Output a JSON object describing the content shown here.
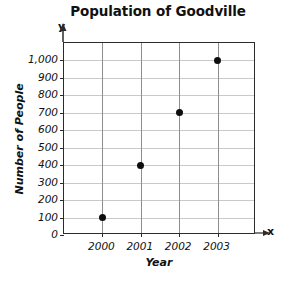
{
  "chart_data": {
    "type": "scatter",
    "title": "Population of Goodville",
    "xlabel": "Year",
    "ylabel": "Number of People",
    "x_axis_letter": "x",
    "y_axis_letter": "y",
    "categories": [
      "2000",
      "2001",
      "2002",
      "2003"
    ],
    "x": [
      2000,
      2001,
      2002,
      2003
    ],
    "values": [
      100,
      400,
      700,
      1000
    ],
    "points": [
      {
        "x": "2000",
        "y": 100
      },
      {
        "x": "2001",
        "y": 400
      },
      {
        "x": "2002",
        "y": 700
      },
      {
        "x": "2003",
        "y": 1000
      }
    ],
    "ylim": [
      0,
      1100
    ],
    "yticks": [
      0,
      100,
      200,
      300,
      400,
      500,
      600,
      700,
      800,
      900,
      1000
    ],
    "ytick_labels": [
      "0",
      "100",
      "200",
      "300",
      "400",
      "500",
      "600",
      "700",
      "800",
      "900",
      "1,000"
    ],
    "xtick_labels": [
      "2000",
      "2001",
      "2002",
      "2003"
    ],
    "grid": true,
    "legend": null,
    "colors": {
      "point": "#0d0d0d",
      "frame": "#2b2b2b",
      "gridline_horizontal": "#c9c9c9",
      "gridline_vertical": "#8d8d8d",
      "background": "#ffffff",
      "text": "#111111"
    }
  }
}
